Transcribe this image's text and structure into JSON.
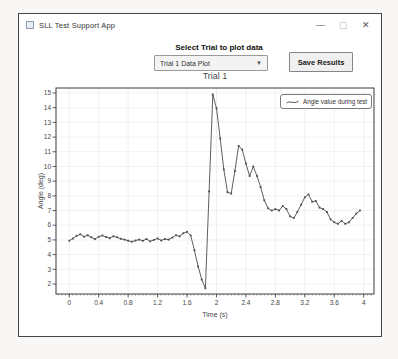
{
  "window": {
    "title": "SLL Test Support App",
    "controls": {
      "minimize": "—",
      "maximize": "▢",
      "close": "✕"
    }
  },
  "toolbar": {
    "select_label": "Select Trial to plot data",
    "dropdown_value": "Trial 1 Data Plot",
    "save_button": "Save Results"
  },
  "chart_data": {
    "type": "line",
    "title": "Trial 1",
    "xlabel": "Time (s)",
    "ylabel": "Angle (deg)",
    "legend_position": "top-right",
    "grid": true,
    "line_color": "#4d4d4d",
    "grid_color": "#ebebeb",
    "axis_color": "#3a3a3a",
    "xlim": [
      -0.18,
      4.14
    ],
    "ylim": [
      1.32,
      15.34
    ],
    "x_ticks": [
      0,
      0.4,
      0.8,
      1.2,
      1.6,
      2,
      2.4,
      2.8,
      3.2,
      3.6,
      4
    ],
    "x_tick_labels": [
      "0",
      "0.4",
      "0.8",
      "1.2",
      "1.6",
      "2",
      "2.4",
      "2.8",
      "3.2",
      "3.6",
      "4"
    ],
    "x_minor_tick_step": 0.05,
    "y_ticks": [
      2,
      3,
      4,
      5,
      6,
      7,
      8,
      9,
      10,
      11,
      12,
      13,
      14,
      15
    ],
    "series": [
      {
        "name": "Angle value during test",
        "x": [
          0,
          0.05,
          0.1,
          0.15,
          0.2,
          0.25,
          0.3,
          0.35,
          0.4,
          0.45,
          0.5,
          0.55,
          0.6,
          0.65,
          0.7,
          0.75,
          0.8,
          0.85,
          0.9,
          0.95,
          1,
          1.05,
          1.1,
          1.15,
          1.2,
          1.25,
          1.3,
          1.35,
          1.4,
          1.45,
          1.5,
          1.55,
          1.6,
          1.65,
          1.7,
          1.75,
          1.8,
          1.85,
          1.9,
          1.95,
          2,
          2.05,
          2.1,
          2.15,
          2.2,
          2.25,
          2.3,
          2.35,
          2.4,
          2.45,
          2.5,
          2.55,
          2.6,
          2.65,
          2.7,
          2.75,
          2.8,
          2.85,
          2.9,
          2.95,
          3,
          3.05,
          3.1,
          3.15,
          3.2,
          3.25,
          3.3,
          3.35,
          3.4,
          3.45,
          3.5,
          3.55,
          3.6,
          3.65,
          3.7,
          3.75,
          3.8,
          3.85,
          3.9,
          3.95
        ],
        "y": [
          4.95,
          5.1,
          5.28,
          5.38,
          5.22,
          5.32,
          5.18,
          5.05,
          5.22,
          5.3,
          5.2,
          5.12,
          5.25,
          5.18,
          5.08,
          5.02,
          4.95,
          4.88,
          4.96,
          5.02,
          4.94,
          5.06,
          4.9,
          5,
          5.1,
          4.96,
          5.06,
          5.02,
          5.16,
          5.32,
          5.24,
          5.45,
          5.55,
          5.3,
          4.3,
          3.2,
          2.3,
          1.7,
          8.3,
          14.9,
          13.95,
          11.9,
          9.8,
          8.25,
          8.15,
          9.7,
          11.4,
          11.15,
          10.2,
          9.35,
          10,
          9.35,
          8.6,
          7.7,
          7.15,
          7,
          7.1,
          7,
          7.3,
          7.1,
          6.6,
          6.5,
          6.9,
          7.4,
          7.9,
          8.1,
          7.6,
          7.65,
          7.2,
          7.1,
          6.9,
          6.4,
          6.2,
          6.1,
          6.3,
          6.1,
          6.2,
          6.5,
          6.8,
          7
        ]
      }
    ]
  }
}
